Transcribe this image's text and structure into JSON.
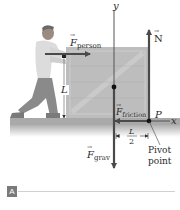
{
  "figure": {
    "panel_label": "A",
    "labels": {
      "y_axis": "y",
      "x_axis": "x",
      "f_person_symbol": "F",
      "f_person_sub": "person",
      "normal_symbol": "N",
      "f_friction_symbol": "F",
      "f_friction_sub": "friction",
      "f_grav_symbol": "F",
      "f_grav_sub": "grav",
      "height_L": "L",
      "half_L_num": "L",
      "half_L_den": "2",
      "pivot_P": "P",
      "pivot_line1": "Pivot",
      "pivot_line2": "point"
    },
    "colors": {
      "arrow": "#4a4a4a",
      "crate": "#b9b9b9",
      "crate_brace": "#c9c9c9",
      "floor": "#a9a9a9",
      "person": "#8c8c8c",
      "badge": "#7a7a7a",
      "rule": "#d0d0d0"
    }
  }
}
